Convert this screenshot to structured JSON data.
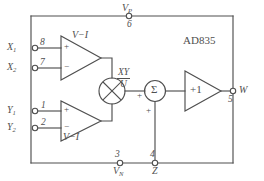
{
  "diagram": {
    "part_number": "AD835",
    "colors": {
      "line": "#4f4f4f",
      "background": "#ffffff",
      "text": "#4f4f4f"
    },
    "supplies": {
      "positive": {
        "label": "V",
        "subscript": "P",
        "pin": "6"
      },
      "negative": {
        "label": "V",
        "subscript": "N",
        "pin": "3"
      }
    },
    "inputs": {
      "x1": {
        "label": "X",
        "subscript": "1",
        "pin": "8"
      },
      "x2": {
        "label": "X",
        "subscript": "2",
        "pin": "7"
      },
      "y1": {
        "label": "Y",
        "subscript": "1",
        "pin": "1"
      },
      "y2": {
        "label": "Y",
        "subscript": "2",
        "pin": "2"
      },
      "z": {
        "label": "Z",
        "subscript": "",
        "pin": "4"
      }
    },
    "output": {
      "label": "W",
      "subscript": "",
      "pin": "5"
    },
    "blocks": {
      "vi_top": {
        "label": "V−I",
        "plus": "+",
        "minus": "−"
      },
      "vi_bottom": {
        "label": "V−I",
        "plus": "+",
        "minus": "−"
      },
      "multiplier": {
        "symbol": "⊗"
      },
      "summer": {
        "symbol": "Σ",
        "plus_left": "+",
        "plus_bottom": "+"
      },
      "buffer": {
        "label": "+1"
      }
    },
    "transfer_function": {
      "numerator": "XY",
      "denominator": "U"
    }
  }
}
